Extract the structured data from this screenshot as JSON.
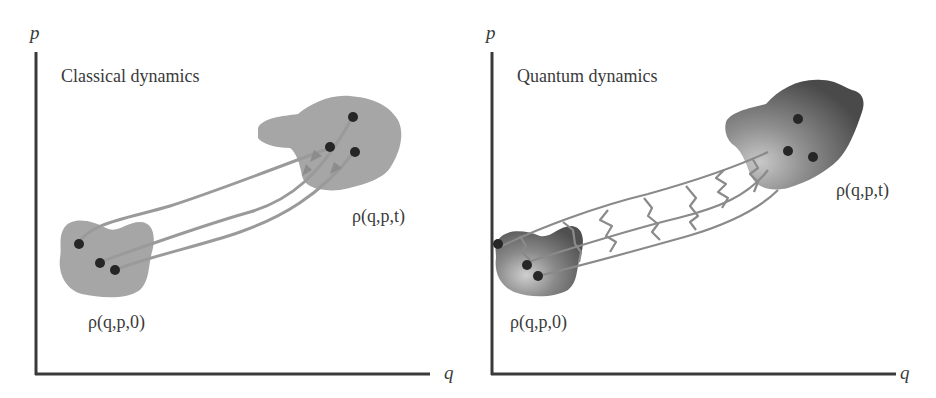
{
  "panels": [
    {
      "id": "classical",
      "title": "Classical dynamics",
      "y_axis_label": "p",
      "x_axis_label": "q",
      "initial_label": "ρ(q,p,0)",
      "final_label": "ρ(q,p,t)",
      "initial_points": 3,
      "final_points": 3,
      "trajectories": 3,
      "blob_color": "#a6a6a6",
      "trajectory_color": "#9a9a9a"
    },
    {
      "id": "quantum",
      "title": "Quantum dynamics",
      "y_axis_label": "p",
      "x_axis_label": "q",
      "initial_label": "ρ(q,p,0)",
      "final_label": "ρ(q,p,t)",
      "initial_points": 3,
      "final_points": 3,
      "trajectories": 3,
      "blob_color": "#6e6e6e",
      "trajectory_color": "#8a8a8a"
    }
  ],
  "colors": {
    "axis": "#3a3a3a",
    "point": "#262626",
    "background": "#ffffff"
  }
}
